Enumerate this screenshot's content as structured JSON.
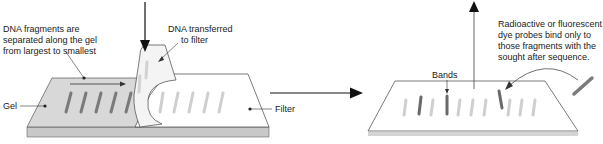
{
  "diagram": {
    "type": "southern-blot-process",
    "labels": {
      "fragments_line1": "DNA fragments are",
      "fragments_line2": "separated along the gel",
      "fragments_line3": "from largest to smallest",
      "transfer_line1": "DNA transferred",
      "transfer_line2": "to filter",
      "gel": "Gel",
      "filter": "Filter",
      "bands": "Bands",
      "probe_line1": "Radioactive or fluorescent",
      "probe_line2": "dye probes bind only to",
      "probe_line3": "those fragments with the",
      "probe_line4": "sought after sequence."
    },
    "colors": {
      "gel_surface": "#d8d8d8",
      "gel_edge": "#bdbdbd",
      "band_dark": "#777777",
      "band_light": "#cfcfcf",
      "filter": "#ffffff",
      "outline": "#333333",
      "arrow": "#111111"
    }
  }
}
